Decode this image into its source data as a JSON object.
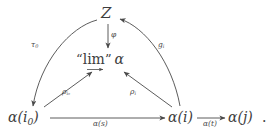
{
  "diagram": {
    "kind": "commutative-diagram",
    "background_color": "#ffffff",
    "ink_color": "#3d3d3d",
    "nodes": {
      "z": "Z",
      "colimit_quote_open": "“",
      "colimit_word": "lim",
      "colimit_quote_close": "”",
      "colimit_functor": "α",
      "alpha_i0": "α(i",
      "alpha_i0_sub": "0",
      "alpha_i0_close": ")",
      "alpha_i": "α(i)",
      "alpha_j": "α(j)",
      "trailing_period": "."
    },
    "edge_labels": {
      "phi": "φ",
      "tau_0": "τ",
      "tau_0_sub": "0",
      "g_i": "g",
      "g_i_sub": "i",
      "rho_i0": "ρ",
      "rho_i0_sub": "i₀",
      "rho_i": "ρ",
      "rho_i_sub": "i",
      "alpha_s": "α(s)",
      "alpha_t": "α(t)"
    },
    "edges": [
      {
        "name": "phi-arrow",
        "from": "Z",
        "to": "“lim” α",
        "label": "φ",
        "style": "straight-vertical"
      },
      {
        "name": "tau0-arrow",
        "from": "Z",
        "to": "α(i₀)",
        "label": "τ₀",
        "style": "curved"
      },
      {
        "name": "gi-arrow",
        "from": "α(i)",
        "to": "Z",
        "label": "gᵢ",
        "style": "curved"
      },
      {
        "name": "rho-i0-arrow",
        "from": "α(i₀)",
        "to": "“lim” α",
        "label": "ρᵢ₀",
        "style": "straight"
      },
      {
        "name": "rho-i-arrow",
        "from": "α(i)",
        "to": "“lim” α",
        "label": "ρᵢ",
        "style": "straight"
      },
      {
        "name": "alpha-s-arrow",
        "from": "α(i₀)",
        "to": "α(i)",
        "label": "α(s)",
        "style": "straight-horizontal"
      },
      {
        "name": "alpha-t-arrow",
        "from": "α(i)",
        "to": "α(j)",
        "label": "α(t)",
        "style": "straight-horizontal"
      }
    ]
  }
}
